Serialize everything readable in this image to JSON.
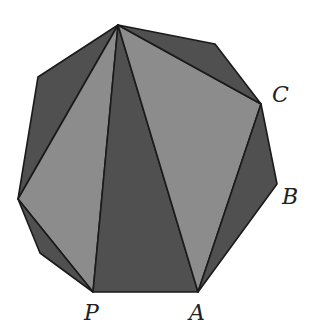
{
  "diagram": {
    "colors": {
      "dark": "#505050",
      "light": "#8c8c8c",
      "edge": "#1a1a1a",
      "background": "#ffffff"
    },
    "vertices": {
      "T": [
        118,
        25
      ],
      "R1": [
        215,
        44
      ],
      "C": [
        261,
        104
      ],
      "B": [
        277,
        184
      ],
      "A": [
        198,
        292
      ],
      "P": [
        93,
        292
      ],
      "LL": [
        40,
        253
      ],
      "L": [
        18,
        199
      ],
      "UL": [
        38,
        77
      ]
    },
    "triangles": [
      {
        "name": "T-UL-L",
        "points": [
          "T",
          "UL",
          "L"
        ],
        "shade": "dark"
      },
      {
        "name": "T-L-P",
        "points": [
          "T",
          "L",
          "P"
        ],
        "shade": "light"
      },
      {
        "name": "L-LL-P",
        "points": [
          "L",
          "LL",
          "P"
        ],
        "shade": "dark"
      },
      {
        "name": "T-P-A",
        "points": [
          "T",
          "P",
          "A"
        ],
        "shade": "dark"
      },
      {
        "name": "T-A-C",
        "points": [
          "T",
          "A",
          "C"
        ],
        "shade": "light"
      },
      {
        "name": "T-R1-C",
        "points": [
          "T",
          "R1",
          "C"
        ],
        "shade": "dark"
      },
      {
        "name": "C-B-A",
        "points": [
          "C",
          "B",
          "A"
        ],
        "shade": "dark"
      }
    ],
    "labels": [
      {
        "text": "C",
        "x": 272,
        "y": 102
      },
      {
        "text": "B",
        "x": 282,
        "y": 204
      },
      {
        "text": "A",
        "x": 189,
        "y": 320
      },
      {
        "text": "P",
        "x": 84,
        "y": 320
      }
    ]
  }
}
